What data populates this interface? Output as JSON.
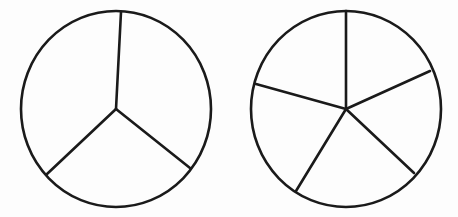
{
  "diagram": {
    "title": "",
    "stroke_color": "#1a1a1a",
    "background": "#fdfdfd",
    "circles": [
      {
        "name": "circle-divided-into-3",
        "parts": 3,
        "center": [
          116,
          109
        ],
        "rx": 95,
        "ry": 98,
        "spoke_endpoints": [
          [
            121,
            12
          ],
          [
            190,
            168
          ],
          [
            47,
            174
          ]
        ]
      },
      {
        "name": "circle-divided-into-5",
        "parts": 5,
        "center": [
          346,
          109
        ],
        "rx": 95,
        "ry": 98,
        "spoke_endpoints": [
          [
            346,
            11
          ],
          [
            430,
            71
          ],
          [
            414,
            173
          ],
          [
            296,
            191
          ],
          [
            256,
            84
          ]
        ]
      }
    ]
  }
}
